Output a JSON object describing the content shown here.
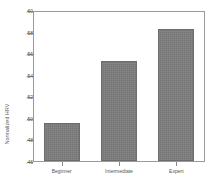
{
  "chart_data": {
    "type": "bar",
    "title": "",
    "subtitle": "",
    "xlabel": "",
    "ylabel": "Normalized HRV",
    "categories": [
      "Beginner",
      "Intermediate",
      "Expert"
    ],
    "values": [
      0.495,
      0.553,
      0.582
    ],
    "ylim": [
      0.46,
      0.6
    ],
    "yticks": [
      0.46,
      0.48,
      0.5,
      0.52,
      0.54,
      0.56,
      0.58,
      0.6
    ],
    "ytick_labels": [
      ".46",
      ".48",
      ".50",
      ".52",
      ".54",
      ".56",
      ".58",
      ".60"
    ],
    "grid": false,
    "legend": null,
    "legend_position": "none",
    "bar_color": "#7d7d7d",
    "bar_edge_color": "#6d6d6d",
    "axis_color": "#9a9a9a",
    "text_color": "#555555",
    "background": "#ffffff"
  }
}
